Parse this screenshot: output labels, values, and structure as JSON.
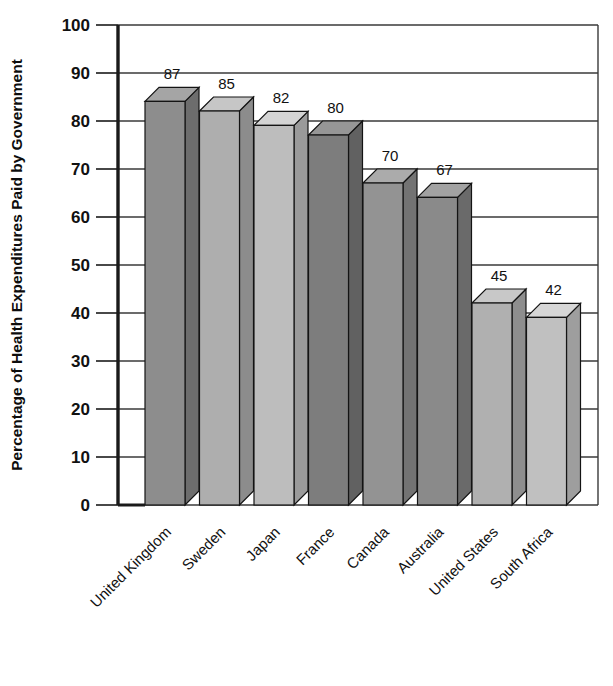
{
  "chart_data": {
    "type": "bar",
    "title": "",
    "subtitle": "",
    "xlabel": "",
    "ylabel": "Percentage of Health Expenditures Paid by Government",
    "categories": [
      "United Kingdom",
      "Sweden",
      "Japan",
      "France",
      "Canada",
      "Australia",
      "United States",
      "South Africa"
    ],
    "values": [
      87,
      85,
      82,
      80,
      70,
      67,
      45,
      42
    ],
    "data_labels": [
      "87",
      "85",
      "82",
      "80",
      "70",
      "67",
      "45",
      "42"
    ],
    "ylim": [
      0,
      100
    ],
    "ytick_values": [
      0,
      10,
      20,
      30,
      40,
      50,
      60,
      70,
      80,
      90,
      100
    ],
    "ytick_labels": [
      "0",
      "10",
      "20",
      "30",
      "40",
      "50",
      "60",
      "70",
      "80",
      "90",
      "100"
    ],
    "grid": true,
    "grid_axis": "y",
    "legend": false,
    "legend_position": "none",
    "style_3d": true,
    "x_tick_label_rotation": 45,
    "bar_colors": [
      {
        "category": "United Kingdom",
        "front": "#8d8d8d",
        "top": "#a5a5a5",
        "side": "#6d6d6d"
      },
      {
        "category": "Sweden",
        "front": "#aeaeae",
        "top": "#c6c6c6",
        "side": "#8c8c8c"
      },
      {
        "category": "Japan",
        "front": "#bdbdbd",
        "top": "#d4d4d4",
        "side": "#9a9a9a"
      },
      {
        "category": "France",
        "front": "#7d7d7d",
        "top": "#969696",
        "side": "#616161"
      },
      {
        "category": "Canada",
        "front": "#939393",
        "top": "#ababab",
        "side": "#737373"
      },
      {
        "category": "Australia",
        "front": "#8a8a8a",
        "top": "#a2a2a2",
        "side": "#6a6a6a"
      },
      {
        "category": "United States",
        "front": "#b0b0b0",
        "top": "#c8c8c8",
        "side": "#8e8e8e"
      },
      {
        "category": "South Africa",
        "front": "#c0c0c0",
        "top": "#d6d6d6",
        "side": "#9e9e9e"
      }
    ],
    "axis_color": "#1a1a1a",
    "grid_color": "#3a3a3a",
    "background_color": "#ffffff"
  }
}
